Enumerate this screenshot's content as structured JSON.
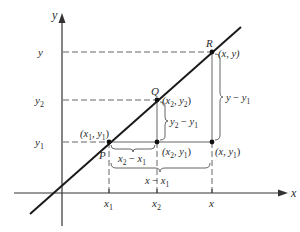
{
  "figure": {
    "axes": {
      "x_label": "x",
      "y_label": "y",
      "x_ticks": [
        "x",
        "1",
        "x",
        "2",
        "x"
      ],
      "x_tick_labels": [
        {
          "base": "x",
          "sub": "1"
        },
        {
          "base": "x",
          "sub": "2"
        },
        {
          "base": "x",
          "sub": ""
        }
      ],
      "y_tick_labels": [
        {
          "base": "y",
          "sub": ""
        },
        {
          "base": "y",
          "sub": "2"
        },
        {
          "base": "y",
          "sub": "1"
        }
      ]
    },
    "points": {
      "P": {
        "name": "P",
        "coord_label": "(x",
        "coord_sub1": "1",
        "coord_mid": ", y",
        "coord_sub2": "1",
        "coord_end": ")"
      },
      "Q": {
        "name": "Q",
        "coord_label": "(x",
        "coord_sub1": "2",
        "coord_mid": ", y",
        "coord_sub2": "2",
        "coord_end": ")"
      },
      "R": {
        "name": "R",
        "coord_label": "(x, y)"
      },
      "corner_Q": {
        "coord_label": "(x",
        "coord_sub1": "2",
        "coord_mid": ", y",
        "coord_sub2": "1",
        "coord_end": ")"
      },
      "corner_R": {
        "coord_label": "(x, y",
        "coord_sub": "1",
        "coord_end": ")"
      }
    },
    "braces": {
      "x2_minus_x1": {
        "a": "x",
        "a_sub": "2",
        "op": " − ",
        "b": "x",
        "b_sub": "1"
      },
      "x_minus_x1": {
        "a": "x",
        "op": " − ",
        "b": "x",
        "b_sub": "1"
      },
      "y2_minus_y1": {
        "a": "y",
        "a_sub": "2",
        "op": " − ",
        "b": "y",
        "b_sub": "1"
      },
      "y_minus_y1": {
        "a": "y",
        "op": " − ",
        "b": "y",
        "b_sub": "1"
      }
    },
    "colors": {
      "line": "#1a1a1a",
      "axis": "#333333",
      "guide": "#555555",
      "text": "#2a2a2a",
      "background": "#ffffff"
    }
  }
}
